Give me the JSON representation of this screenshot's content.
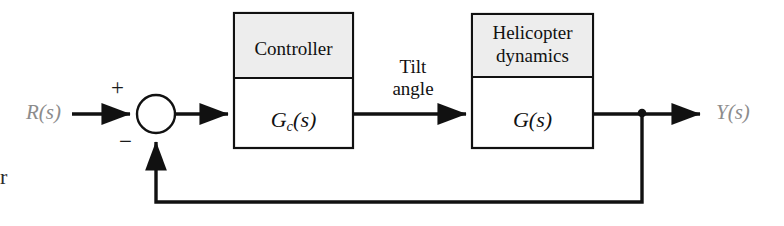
{
  "diagram": {
    "type": "control-system-block-diagram",
    "background_color": "#ffffff",
    "line_color": "#111111",
    "block_header_fill": "#ededed",
    "external_signal_color": "#8c8c8c"
  },
  "signals": {
    "input": "R(s)",
    "output": "Y(s)",
    "intermediate_line1": "Tilt",
    "intermediate_line2": "angle"
  },
  "summing_junction": {
    "name": "summing-junction",
    "plus_sign": "+",
    "minus_sign": "−",
    "shape": "open-circle"
  },
  "blocks": [
    {
      "id": "controller",
      "header": "Controller",
      "transfer_function_base": "G",
      "transfer_function_subscript": "c",
      "transfer_function_arg": "(s)",
      "transfer_function_full": "Gc(s)"
    },
    {
      "id": "plant",
      "header_line1": "Helicopter",
      "header_line2": "dynamics",
      "transfer_function_base": "G",
      "transfer_function_subscript": "",
      "transfer_function_arg": "(s)",
      "transfer_function_full": "G(s)"
    }
  ],
  "connections": [
    {
      "from": "R(s)",
      "to": "summing-junction",
      "arrow": true
    },
    {
      "from": "summing-junction",
      "to": "controller",
      "arrow": true
    },
    {
      "from": "controller",
      "to": "plant",
      "arrow": true,
      "label": "Tilt angle"
    },
    {
      "from": "plant",
      "to": "Y(s)",
      "arrow": true
    },
    {
      "from": "feedback-node",
      "to": "summing-junction",
      "arrow": true,
      "path": "down-left-up"
    }
  ],
  "artifact": {
    "edge_fragment": "r"
  }
}
